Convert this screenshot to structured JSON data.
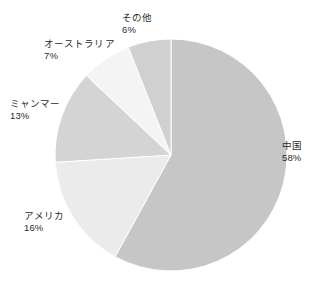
{
  "chart_data": {
    "type": "pie",
    "title": "",
    "subtitle": "",
    "xlabel": "",
    "ylabel": "",
    "legend": "none",
    "grid": false,
    "value_unit": "%",
    "start_angle_deg": 0,
    "direction": "clockwise",
    "categories": [
      "中国",
      "アメリカ",
      "ミャンマー",
      "オーストラリア",
      "その他"
    ],
    "values": [
      58,
      16,
      13,
      7,
      6
    ],
    "slices": [
      {
        "id": "china",
        "label": "中国",
        "value": 58,
        "percent_text": "58%",
        "color": "#c6c6c6"
      },
      {
        "id": "usa",
        "label": "アメリカ",
        "value": 16,
        "percent_text": "16%",
        "color": "#ebebeb"
      },
      {
        "id": "myanmar",
        "label": "ミャンマー",
        "value": 13,
        "percent_text": "13%",
        "color": "#d4d4d4"
      },
      {
        "id": "australia",
        "label": "オーストラリア",
        "value": 7,
        "percent_text": "7%",
        "color": "#f4f4f4"
      },
      {
        "id": "other",
        "label": "その他",
        "value": 6,
        "percent_text": "6%",
        "color": "#d0d0d0"
      }
    ],
    "colors": {
      "background": "#ffffff",
      "text": "#2b2b2b",
      "slice_stroke": "#ffffff"
    }
  }
}
